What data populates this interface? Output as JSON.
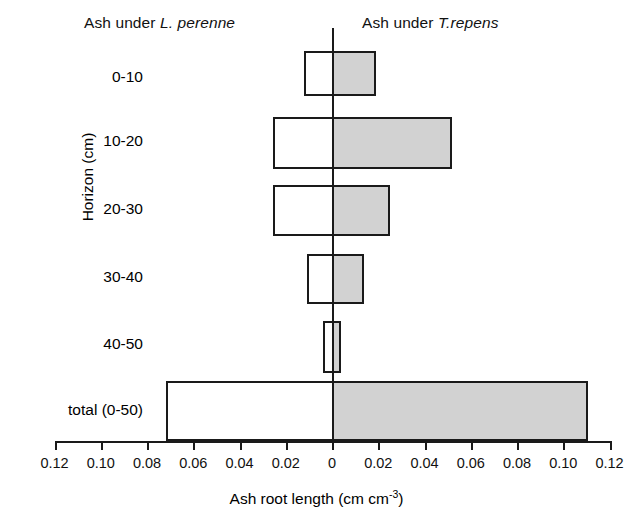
{
  "chart_data": {
    "type": "bar",
    "orientation": "horizontal-diverging",
    "title": "",
    "xlabel": "Ash root length (cm cm-3)",
    "xlabel_parts": {
      "text": "Ash root length (cm cm",
      "sup": "-3",
      "tail": ")"
    },
    "ylabel": "Horizon (cm)",
    "categories": [
      "0-10",
      "10-20",
      "20-30",
      "30-40",
      "40-50",
      "total  (0-50)"
    ],
    "series": [
      {
        "name": "Ash under L. perenne",
        "name_parts": {
          "prefix": "Ash under ",
          "species": "L. perenne"
        },
        "side": "left",
        "fill": "#ffffff",
        "values": [
          0.012,
          0.0255,
          0.0255,
          0.011,
          0.004,
          0.072
        ]
      },
      {
        "name": "Ash under T.repens",
        "name_parts": {
          "prefix": "Ash under ",
          "species": "T.repens"
        },
        "side": "right",
        "fill": "#d2d2d2",
        "values": [
          0.018,
          0.051,
          0.024,
          0.013,
          0.003,
          0.11
        ]
      }
    ],
    "xlim": [
      -0.12,
      0.12
    ],
    "xtick_step": 0.02,
    "xtick_labels": [
      "0.12",
      "0.10",
      "0.08",
      "0.06",
      "0.04",
      "0.02",
      "0",
      "0.02",
      "0.04",
      "0.06",
      "0.08",
      "0.10",
      "0.12"
    ],
    "xtick_values": [
      -0.12,
      -0.1,
      -0.08,
      -0.06,
      -0.04,
      -0.02,
      0,
      0.02,
      0.04,
      0.06,
      0.08,
      0.1,
      0.12
    ],
    "grid": false,
    "legend": "none",
    "colors": {
      "bar_outline": "#1a1a1a",
      "left_fill": "#ffffff",
      "right_fill": "#d2d2d2",
      "axis": "#1a1a1a"
    }
  },
  "layout": {
    "bar_rows": [
      {
        "top": 23,
        "height": 45
      },
      {
        "top": 89,
        "height": 52
      },
      {
        "top": 157,
        "height": 51
      },
      {
        "top": 226,
        "height": 50
      },
      {
        "top": 293,
        "height": 52
      },
      {
        "top": 353,
        "height": 60
      }
    ],
    "label_centers": [
      78,
      142,
      210,
      278,
      345,
      411
    ],
    "plot": {
      "left": 55,
      "top": 28,
      "width": 555,
      "height": 413,
      "zero_x": 277,
      "px_per_unit": 2312.5
    }
  }
}
